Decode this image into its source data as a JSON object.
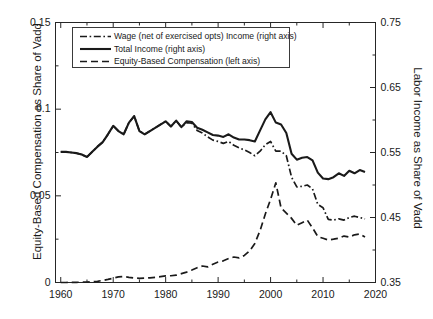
{
  "chart_data": {
    "type": "line",
    "title": "",
    "xlabel": "",
    "ylabel": "Equity-Based Compensation as Share of Vadd",
    "ylabel_right": "Labor Income as Share of Vadd",
    "xlim": [
      1959,
      2020
    ],
    "ylim_left": [
      0,
      0.15
    ],
    "ylim_right": [
      0.35,
      0.75
    ],
    "xticks": [
      1960,
      1970,
      1980,
      1990,
      2000,
      2010,
      2020
    ],
    "xticklabels": [
      "1960",
      "1970",
      "1980",
      "1990",
      "2000",
      "2010",
      "2020"
    ],
    "yticks_left": [
      0,
      0.05,
      0.1,
      0.15
    ],
    "yticklabels_left": [
      "0",
      "0.05",
      "0.1",
      "0.15"
    ],
    "yticks_right": [
      0.35,
      0.45,
      0.55,
      0.65,
      0.75
    ],
    "yticklabels_right": [
      "0.35",
      "0.45",
      "0.55",
      "0.65",
      "0.75"
    ],
    "grid": false,
    "legend_position": "upper left",
    "line_color": "#1a1a1a",
    "x": [
      1960,
      1961,
      1962,
      1963,
      1964,
      1965,
      1966,
      1967,
      1968,
      1969,
      1970,
      1971,
      1972,
      1973,
      1974,
      1975,
      1976,
      1977,
      1978,
      1979,
      1980,
      1981,
      1982,
      1983,
      1984,
      1985,
      1986,
      1987,
      1988,
      1989,
      1990,
      1991,
      1992,
      1993,
      1994,
      1995,
      1996,
      1997,
      1998,
      1999,
      2000,
      2001,
      2002,
      2003,
      2004,
      2005,
      2006,
      2007,
      2008,
      2009,
      2010,
      2011,
      2012,
      2013,
      2014,
      2015,
      2016,
      2017,
      2018
    ],
    "series": [
      {
        "name": "Total Income (right axis)",
        "axis": "right",
        "style": "solid",
        "values": [
          0.551,
          0.551,
          0.55,
          0.549,
          0.547,
          0.543,
          0.551,
          0.559,
          0.566,
          0.578,
          0.591,
          0.583,
          0.578,
          0.596,
          0.606,
          0.583,
          0.578,
          0.583,
          0.588,
          0.593,
          0.598,
          0.59,
          0.599,
          0.589,
          0.598,
          0.597,
          0.588,
          0.585,
          0.581,
          0.577,
          0.576,
          0.574,
          0.578,
          0.573,
          0.57,
          0.57,
          0.569,
          0.567,
          0.584,
          0.601,
          0.612,
          0.596,
          0.593,
          0.58,
          0.548,
          0.539,
          0.542,
          0.543,
          0.538,
          0.519,
          0.51,
          0.509,
          0.512,
          0.518,
          0.514,
          0.522,
          0.518,
          0.523,
          0.52
        ]
      },
      {
        "name": "Wage (net of exercised opts) Income (right axis)",
        "axis": "right",
        "style": "dashdot",
        "values": [
          0.551,
          0.551,
          0.55,
          0.549,
          0.547,
          0.543,
          0.551,
          0.559,
          0.566,
          0.578,
          0.591,
          0.583,
          0.578,
          0.596,
          0.606,
          0.583,
          0.578,
          0.583,
          0.588,
          0.593,
          0.598,
          0.59,
          0.599,
          0.589,
          0.596,
          0.595,
          0.584,
          0.58,
          0.574,
          0.569,
          0.567,
          0.564,
          0.567,
          0.561,
          0.557,
          0.554,
          0.55,
          0.545,
          0.552,
          0.562,
          0.567,
          0.552,
          0.552,
          0.545,
          0.512,
          0.497,
          0.498,
          0.5,
          0.494,
          0.47,
          0.465,
          0.447,
          0.446,
          0.448,
          0.446,
          0.45,
          0.452,
          0.45,
          0.448
        ]
      },
      {
        "name": "Equity-Based Compensation (left axis)",
        "axis": "left",
        "style": "dashed",
        "values": [
          0.0,
          0.0,
          0.0001,
          0.0001,
          0.0002,
          0.0002,
          0.0004,
          0.0007,
          0.0012,
          0.0018,
          0.0025,
          0.0032,
          0.0035,
          0.003,
          0.0026,
          0.0024,
          0.0025,
          0.0027,
          0.003,
          0.0034,
          0.0038,
          0.0039,
          0.0042,
          0.0051,
          0.006,
          0.0072,
          0.0085,
          0.0095,
          0.009,
          0.0105,
          0.0118,
          0.0125,
          0.0138,
          0.0147,
          0.0142,
          0.0156,
          0.0182,
          0.0225,
          0.03,
          0.0395,
          0.048,
          0.0575,
          0.043,
          0.04,
          0.037,
          0.033,
          0.0345,
          0.036,
          0.0315,
          0.0265,
          0.0255,
          0.0245,
          0.025,
          0.0256,
          0.0268,
          0.0262,
          0.0275,
          0.028,
          0.0262
        ]
      }
    ]
  },
  "legend": {
    "items": [
      {
        "label": "Wage (net of exercised opts) Income (right axis)",
        "style": "dashdot"
      },
      {
        "label": "Total Income (right axis)",
        "style": "solid"
      },
      {
        "label": "Equity-Based Compensation (left axis)",
        "style": "dashed"
      }
    ]
  }
}
